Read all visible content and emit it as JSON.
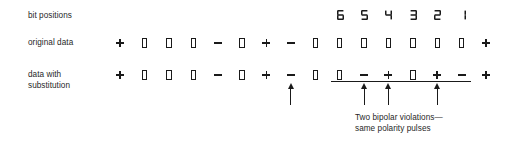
{
  "figure": {
    "type": "signal-encoding-diagram",
    "title_text": "",
    "row_labels": {
      "bit_positions": "bit positions",
      "original_data": "original data",
      "data_with_substitution": "data with\nsubstitution"
    },
    "bit_positions": {
      "labels": [
        "6",
        "5",
        "4",
        "3",
        "2",
        "1"
      ],
      "column_indices": [
        9,
        10,
        11,
        12,
        13,
        14
      ]
    },
    "original_data": {
      "symbols": [
        "+",
        "0",
        "0",
        "0",
        "-",
        "0",
        "+",
        "-",
        "0",
        "0",
        "0",
        "0",
        "0",
        "0",
        "0",
        "+"
      ]
    },
    "data_with_substitution": {
      "symbols": [
        "+",
        "0",
        "0",
        "0",
        "-",
        "0",
        "+",
        "-",
        "0",
        "0",
        "-",
        "+",
        "0",
        "+",
        "-",
        "+"
      ]
    },
    "underline": {
      "start_column": 9,
      "end_column": 14
    },
    "arrows": {
      "column_indices": [
        7,
        10,
        11,
        13
      ]
    },
    "caption": "Two bipolar violations—\nsame polarity pulses",
    "colors": {
      "ink": "#1a1a1a",
      "background": "#ffffff"
    },
    "geometry": {
      "first_column_x": 113,
      "column_spacing": 24.4
    }
  }
}
